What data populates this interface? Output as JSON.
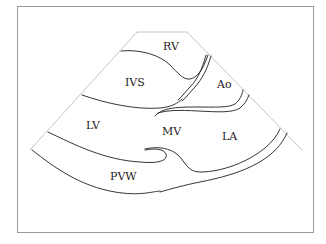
{
  "diagram": {
    "type": "echocardiogram parasternal long-axis schematic",
    "labels": {
      "rv": "RV",
      "ivs": "IVS",
      "ao": "Ao",
      "lv": "LV",
      "mv": "MV",
      "la": "LA",
      "pvw": "PVW"
    }
  }
}
